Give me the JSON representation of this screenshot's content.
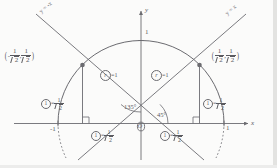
{
  "diagram": {
    "stroke_color": "#6b6b70",
    "background": "#fbfbfa",
    "axes": {
      "x_label": "x",
      "y_label": "y",
      "origin_label": "O",
      "x_tick_left": "-1",
      "x_tick_right": "1",
      "y_tick_top": "1"
    },
    "lines": [
      {
        "name": "line-y-equals-neg-x",
        "label": "y = -x"
      },
      {
        "name": "line-y-equals-x",
        "label": "y = x"
      }
    ],
    "points": [
      {
        "name": "point-left",
        "x_num": "1",
        "x_den": "2",
        "x_sign": "-",
        "y_num": "1",
        "y_den": "2",
        "y_sign": "",
        "open_paren": "(",
        "close_paren": ")",
        "comma": ","
      },
      {
        "name": "point-right",
        "x_num": "1",
        "x_den": "2",
        "x_sign": "",
        "y_num": "1",
        "y_den": "2",
        "y_sign": "",
        "open_paren": "(",
        "close_paren": ")",
        "comma": ","
      }
    ],
    "radius_labels": [
      {
        "name": "radius-left",
        "symbol": "r",
        "equals": "=",
        "value": "1"
      },
      {
        "name": "radius-right",
        "symbol": "r",
        "equals": "=",
        "value": "1"
      }
    ],
    "angles": [
      {
        "name": "angle-135",
        "value": "135°"
      },
      {
        "name": "angle-45",
        "value": "45°"
      }
    ],
    "leg_labels": [
      {
        "name": "leg-vertical-left",
        "circled": "1",
        "equals": "=",
        "num": "1",
        "den": "2"
      },
      {
        "name": "leg-vertical-right",
        "circled": "1",
        "equals": "=",
        "num": "1",
        "den": "2"
      },
      {
        "name": "leg-horizontal-left",
        "circled": "1",
        "equals": "=",
        "num": "1",
        "den": "2"
      },
      {
        "name": "leg-horizontal-right",
        "circled": "1",
        "equals": "=",
        "num": "1",
        "den": "2"
      }
    ]
  }
}
